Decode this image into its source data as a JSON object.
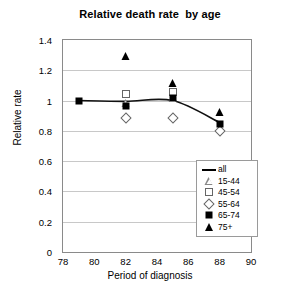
{
  "chart_data": {
    "type": "scatter",
    "title": "Relative death rate  by age",
    "xlabel": "Period of diagnosis",
    "ylabel": "Relative rate",
    "xlim": [
      78,
      90
    ],
    "ylim": [
      0,
      1.4
    ],
    "xticks": [
      78,
      80,
      82,
      84,
      86,
      88,
      90
    ],
    "yticks": [
      "0",
      "0.2",
      "0.4",
      "0.6",
      "0.8",
      "1",
      "1.2",
      "1.4"
    ],
    "grid": true,
    "legend_position": "lower-right",
    "x": [
      79,
      82,
      85,
      88
    ],
    "series": [
      {
        "name": "all",
        "marker": "line",
        "values": [
          1.0,
          0.995,
          1.0,
          0.855
        ]
      },
      {
        "name": "15-44",
        "marker": "open-triangle",
        "values": [
          null,
          0.985,
          1.015,
          null
        ]
      },
      {
        "name": "45-54",
        "marker": "open-square",
        "values": [
          null,
          1.045,
          1.055,
          null
        ]
      },
      {
        "name": "55-64",
        "marker": "open-diamond",
        "values": [
          null,
          0.885,
          0.885,
          0.8
        ]
      },
      {
        "name": "65-74",
        "marker": "filled-square",
        "values": [
          1.0,
          0.965,
          1.015,
          0.845
        ]
      },
      {
        "name": "75+",
        "marker": "filled-triangle",
        "values": [
          null,
          1.295,
          1.115,
          0.925
        ]
      }
    ]
  },
  "legend": {
    "items": [
      {
        "label": "all",
        "key": "line-key"
      },
      {
        "label": "15-44",
        "key": "open-triangle-key"
      },
      {
        "label": "45-54",
        "key": "open-square-key"
      },
      {
        "label": "55-64",
        "key": "open-diamond-key"
      },
      {
        "label": "65-74",
        "key": "filled-square-key"
      },
      {
        "label": "75+",
        "key": "filled-triangle-key"
      }
    ]
  }
}
